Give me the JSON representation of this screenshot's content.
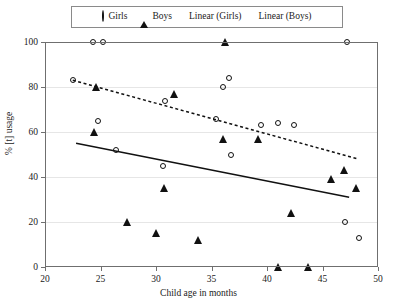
{
  "chart_data": {
    "type": "scatter",
    "title": "",
    "xlabel": "Child age in months",
    "ylabel": "% [t] usage",
    "xlim": [
      20,
      50
    ],
    "ylim": [
      0,
      100
    ],
    "xticks": [
      20,
      25,
      30,
      35,
      40,
      45,
      50
    ],
    "yticks": [
      0,
      20,
      40,
      60,
      80,
      100
    ],
    "grid": true,
    "legend_position": "top-center",
    "series": [
      {
        "name": "Girls",
        "marker": "open-circle",
        "points": [
          [
            24.3,
            100
          ],
          [
            25.2,
            100
          ],
          [
            22.5,
            83
          ],
          [
            24.8,
            65
          ],
          [
            26.4,
            52
          ],
          [
            30.6,
            45
          ],
          [
            30.8,
            74
          ],
          [
            36.6,
            84
          ],
          [
            36.0,
            80
          ],
          [
            35.4,
            66
          ],
          [
            36.8,
            50
          ],
          [
            39.5,
            63
          ],
          [
            41.0,
            64
          ],
          [
            42.4,
            63
          ],
          [
            47.2,
            100
          ],
          [
            47.0,
            20
          ],
          [
            48.3,
            13
          ]
        ]
      },
      {
        "name": "Boys",
        "marker": "filled-triangle",
        "points": [
          [
            24.6,
            80
          ],
          [
            24.4,
            60
          ],
          [
            27.4,
            20
          ],
          [
            30.0,
            15
          ],
          [
            30.7,
            35
          ],
          [
            31.6,
            77
          ],
          [
            33.8,
            12
          ],
          [
            36.2,
            100
          ],
          [
            36.0,
            57
          ],
          [
            39.2,
            57
          ],
          [
            41.0,
            0
          ],
          [
            42.2,
            24
          ],
          [
            43.7,
            0
          ],
          [
            45.8,
            39
          ],
          [
            46.9,
            43
          ],
          [
            48.0,
            35
          ]
        ]
      }
    ],
    "trendlines": [
      {
        "name": "Linear (Girls)",
        "style": "dashed",
        "x_start": 22.5,
        "y_start": 83,
        "x_end": 48.2,
        "y_end": 48
      },
      {
        "name": "Linear (Boys)",
        "style": "solid",
        "x_start": 22.8,
        "y_start": 55,
        "x_end": 47.4,
        "y_end": 31
      }
    ]
  },
  "legend": {
    "items": [
      {
        "label": "Girls",
        "key": "open-circle-marker"
      },
      {
        "label": "Boys",
        "key": "filled-triangle-marker"
      },
      {
        "label": "Linear (Girls)",
        "key": "dashed-line-swatch"
      },
      {
        "label": "Linear (Boys)",
        "key": "solid-line-swatch"
      }
    ]
  }
}
